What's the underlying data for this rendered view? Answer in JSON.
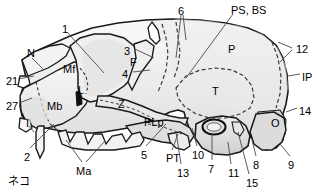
{
  "figure": {
    "caption": "ネコ",
    "colors": {
      "outline": "#1a1a1a",
      "fill_light": "#f4f4f4",
      "fill_mid": "#e2e2e2",
      "fill_shade": "#d2d2d2",
      "dashed": "#3a3a3a",
      "leader": "#4a4a4a",
      "text": "#000000",
      "background": "#ffffff"
    }
  },
  "labels": {
    "numbers": [
      {
        "id": "1",
        "text": "1",
        "x": 62,
        "y": 24
      },
      {
        "id": "2",
        "text": "2",
        "x": 24,
        "y": 152
      },
      {
        "id": "3",
        "text": "3",
        "x": 124,
        "y": 46
      },
      {
        "id": "4",
        "text": "4",
        "x": 122,
        "y": 69
      },
      {
        "id": "5",
        "text": "5",
        "x": 141,
        "y": 150
      },
      {
        "id": "6",
        "text": "6",
        "x": 178,
        "y": 6
      },
      {
        "id": "7",
        "text": "7",
        "x": 208,
        "y": 164
      },
      {
        "id": "8",
        "text": "8",
        "x": 253,
        "y": 160
      },
      {
        "id": "9",
        "text": "9",
        "x": 288,
        "y": 160
      },
      {
        "id": "10",
        "text": "10",
        "x": 192,
        "y": 150
      },
      {
        "id": "11",
        "text": "11",
        "x": 228,
        "y": 168
      },
      {
        "id": "12",
        "text": "12",
        "x": 296,
        "y": 44
      },
      {
        "id": "13",
        "text": "13",
        "x": 177,
        "y": 168
      },
      {
        "id": "14",
        "text": "14",
        "x": 299,
        "y": 106
      },
      {
        "id": "15",
        "text": "15",
        "x": 246,
        "y": 178
      },
      {
        "id": "21",
        "text": "21",
        "x": 6,
        "y": 76
      },
      {
        "id": "27",
        "text": "27",
        "x": 6,
        "y": 101
      }
    ],
    "abbreviations": [
      {
        "id": "N",
        "text": "N",
        "x": 27,
        "y": 48
      },
      {
        "id": "Mf",
        "text": "Mf",
        "x": 63,
        "y": 64
      },
      {
        "id": "L",
        "text": "L",
        "x": 78,
        "y": 85
      },
      {
        "id": "Mb",
        "text": "Mb",
        "x": 47,
        "y": 101
      },
      {
        "id": "I",
        "text": "I",
        "x": 26,
        "y": 118
      },
      {
        "id": "Z",
        "text": "Z",
        "x": 118,
        "y": 99
      },
      {
        "id": "F",
        "text": "F",
        "x": 130,
        "y": 57
      },
      {
        "id": "Ma",
        "text": "Ma",
        "x": 76,
        "y": 166
      },
      {
        "id": "PLp",
        "text": "PLp",
        "x": 144,
        "y": 117
      },
      {
        "id": "PT",
        "text": "PT",
        "x": 166,
        "y": 153
      },
      {
        "id": "P",
        "text": "P",
        "x": 228,
        "y": 44
      },
      {
        "id": "T",
        "text": "T",
        "x": 212,
        "y": 86
      },
      {
        "id": "O",
        "text": "O",
        "x": 271,
        "y": 118
      },
      {
        "id": "IP",
        "text": "IP",
        "x": 302,
        "y": 72
      },
      {
        "id": "PS, BS",
        "text": "PS, BS",
        "x": 231,
        "y": 5
      }
    ]
  }
}
